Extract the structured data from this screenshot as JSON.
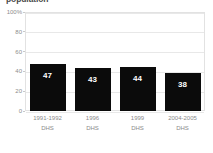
{
  "chart_data": {
    "type": "bar",
    "title": "population",
    "xlabel": "",
    "ylabel": "",
    "ylim": [
      0,
      100
    ],
    "grid": true,
    "legend": "none",
    "orientation": "vertical",
    "bar_color": "#0b0b0b",
    "value_label_color": "#ffffff",
    "categories": [
      "1991-1992 DHS",
      "1996 DHS",
      "1999 DHS",
      "2004-2005 DHS"
    ],
    "category_lines": [
      {
        "line1": "1991-1992",
        "line2": "DHS"
      },
      {
        "line1": "1996",
        "line2": "DHS"
      },
      {
        "line1": "1999",
        "line2": "DHS"
      },
      {
        "line1": "2004-2005",
        "line2": "DHS"
      }
    ],
    "values": [
      47,
      43,
      44,
      38
    ],
    "value_labels": [
      "47",
      "43",
      "44",
      "38"
    ],
    "yticks": [
      0,
      20,
      40,
      60,
      80,
      100
    ],
    "ytick_labels": [
      "0",
      "20",
      "40",
      "60",
      "80",
      "100%"
    ]
  },
  "colors": {
    "background": "#ffffff",
    "bar": "#0b0b0b",
    "grid": "#e8e8e8",
    "border": "#e2e2e2",
    "tick_text": "#8a8a8a",
    "title_text": "#4a4a4a"
  }
}
